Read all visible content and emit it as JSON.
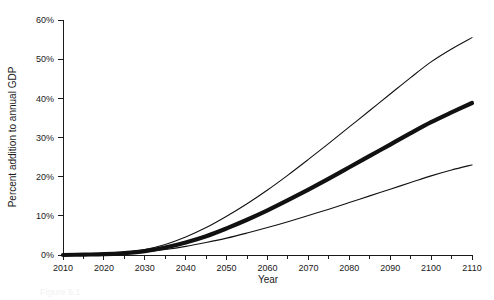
{
  "figure": {
    "background": "#ffffff",
    "line_color": "#111111",
    "caption": "Figure 5.1"
  },
  "chart_data": {
    "type": "line",
    "title": "",
    "subtitle": "",
    "xlabel": "Year",
    "ylabel": "Percent addition to annual GDP",
    "xlim": [
      2010,
      2110
    ],
    "ylim": [
      0,
      60
    ],
    "grid": false,
    "legend_position": "none",
    "x_tick_labels": [
      "2010",
      "2020",
      "2030",
      "2040",
      "2050",
      "2060",
      "2070",
      "2080",
      "2090",
      "2100",
      "2110"
    ],
    "x_ticks": [
      2010,
      2020,
      2030,
      2040,
      2050,
      2060,
      2070,
      2080,
      2090,
      2100,
      2110
    ],
    "x_minor_ticks": [
      2015,
      2025,
      2035,
      2045,
      2055,
      2065,
      2075,
      2085,
      2095,
      2105
    ],
    "y_tick_labels": [
      "0%",
      "10%",
      "20%",
      "30%",
      "40%",
      "50%",
      "60%"
    ],
    "y_ticks": [
      0,
      10,
      20,
      30,
      40,
      50,
      60
    ],
    "x": [
      2010,
      2015,
      2020,
      2025,
      2030,
      2035,
      2040,
      2045,
      2050,
      2055,
      2060,
      2065,
      2070,
      2075,
      2080,
      2085,
      2090,
      2095,
      2100,
      2105,
      2110
    ],
    "series": [
      {
        "name": "Upper bound",
        "style": "thin",
        "values": [
          0.0,
          0.1,
          0.3,
          0.7,
          1.4,
          2.7,
          4.6,
          7.0,
          9.9,
          13.1,
          16.6,
          20.4,
          24.4,
          28.5,
          32.7,
          36.9,
          41.1,
          45.3,
          49.3,
          52.6,
          55.5
        ]
      },
      {
        "name": "Central estimate",
        "style": "thick",
        "values": [
          0.0,
          0.1,
          0.2,
          0.5,
          1.0,
          1.9,
          3.2,
          4.8,
          6.8,
          9.0,
          11.4,
          14.0,
          16.7,
          19.5,
          22.4,
          25.3,
          28.2,
          31.1,
          33.9,
          36.4,
          38.8
        ]
      },
      {
        "name": "Lower bound",
        "style": "thin",
        "values": [
          0.0,
          0.1,
          0.2,
          0.4,
          0.8,
          1.4,
          2.2,
          3.2,
          4.3,
          5.6,
          7.0,
          8.5,
          10.1,
          11.7,
          13.4,
          15.1,
          16.8,
          18.5,
          20.2,
          21.7,
          23.0
        ]
      }
    ]
  }
}
